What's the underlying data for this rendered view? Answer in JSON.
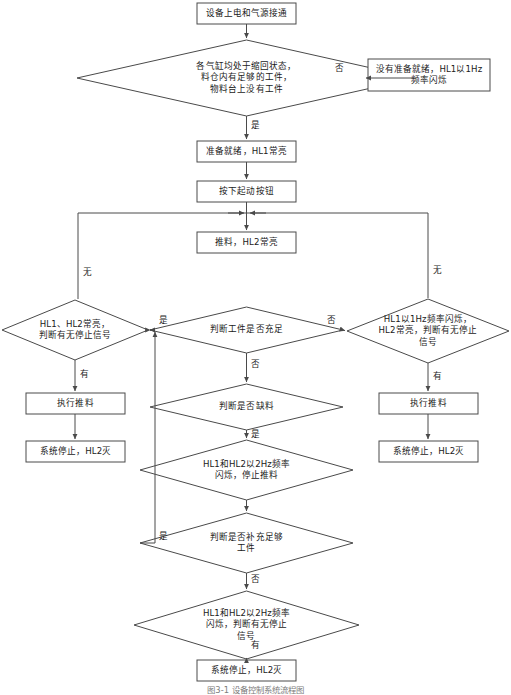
{
  "diagram": {
    "caption": "图3-1 设备控制系统流程图",
    "colors": {
      "stroke": "#4a4a4a",
      "background": "#ffffff",
      "text": "#1a1a1a"
    },
    "nodes": [
      {
        "id": "n1",
        "type": "process",
        "label": "设备上电和气源接通"
      },
      {
        "id": "n2",
        "type": "decision",
        "label": "各气缸均处于缩回状态，\n料仓内有足够的工件，\n物料台上没有工件"
      },
      {
        "id": "n3",
        "type": "process",
        "label": "没有准备就绪，HL1以1Hz\n频率闪烁"
      },
      {
        "id": "n4",
        "type": "process",
        "label": "准备就绪，HL1常亮"
      },
      {
        "id": "n5",
        "type": "process",
        "label": "按下起动按钮"
      },
      {
        "id": "n6",
        "type": "process",
        "label": "推料，HL2常亮"
      },
      {
        "id": "n7",
        "type": "decision",
        "label": "判断工件是否充足"
      },
      {
        "id": "n8",
        "type": "decision",
        "label": "HL1、HL2常亮，\n判断有无停止信号"
      },
      {
        "id": "n9",
        "type": "decision",
        "label": "HL1以1Hz频率闪烁，\nHL2常亮，判断有无停止\n信号"
      },
      {
        "id": "n10",
        "type": "process",
        "label": "执行推料"
      },
      {
        "id": "n11",
        "type": "process",
        "label": "系统停止，HL2灭"
      },
      {
        "id": "n12",
        "type": "process",
        "label": "执行推料"
      },
      {
        "id": "n13",
        "type": "process",
        "label": "系统停止，HL2灭"
      },
      {
        "id": "n14",
        "type": "decision",
        "label": "判断是否缺料"
      },
      {
        "id": "n15",
        "type": "decision",
        "label": "HL1和HL2以2Hz频率\n闪烁，停止推料"
      },
      {
        "id": "n16",
        "type": "decision",
        "label": "判断是否补充足够\n工件"
      },
      {
        "id": "n17",
        "type": "decision",
        "label": "HL1和HL2以2Hz频率\n闪烁，判断有无停止\n信号"
      },
      {
        "id": "n18",
        "type": "process",
        "label": "系统停止，HL2灭"
      }
    ],
    "edge_labels": [
      {
        "id": "e1",
        "text": "否",
        "from": "n2",
        "to": "n3"
      },
      {
        "id": "e2",
        "text": "是",
        "from": "n2",
        "to": "n4"
      },
      {
        "id": "e3",
        "text": "是",
        "from": "n7",
        "to": "n8"
      },
      {
        "id": "e4",
        "text": "否",
        "from": "n7",
        "to": "n9"
      },
      {
        "id": "e5",
        "text": "无",
        "from": "n8",
        "to": "loop"
      },
      {
        "id": "e6",
        "text": "无",
        "from": "n9",
        "to": "loop"
      },
      {
        "id": "e7",
        "text": "有",
        "from": "n8",
        "to": "n10"
      },
      {
        "id": "e8",
        "text": "有",
        "from": "n9",
        "to": "n12"
      },
      {
        "id": "e9",
        "text": "否",
        "from": "n7",
        "to": "n14"
      },
      {
        "id": "e10",
        "text": "是",
        "from": "n14",
        "to": "n15"
      },
      {
        "id": "e11",
        "text": "是",
        "from": "n16",
        "to": "n7"
      },
      {
        "id": "e12",
        "text": "否",
        "from": "n16",
        "to": "n17"
      },
      {
        "id": "e13",
        "text": "有",
        "from": "n17",
        "to": "n18"
      }
    ]
  }
}
